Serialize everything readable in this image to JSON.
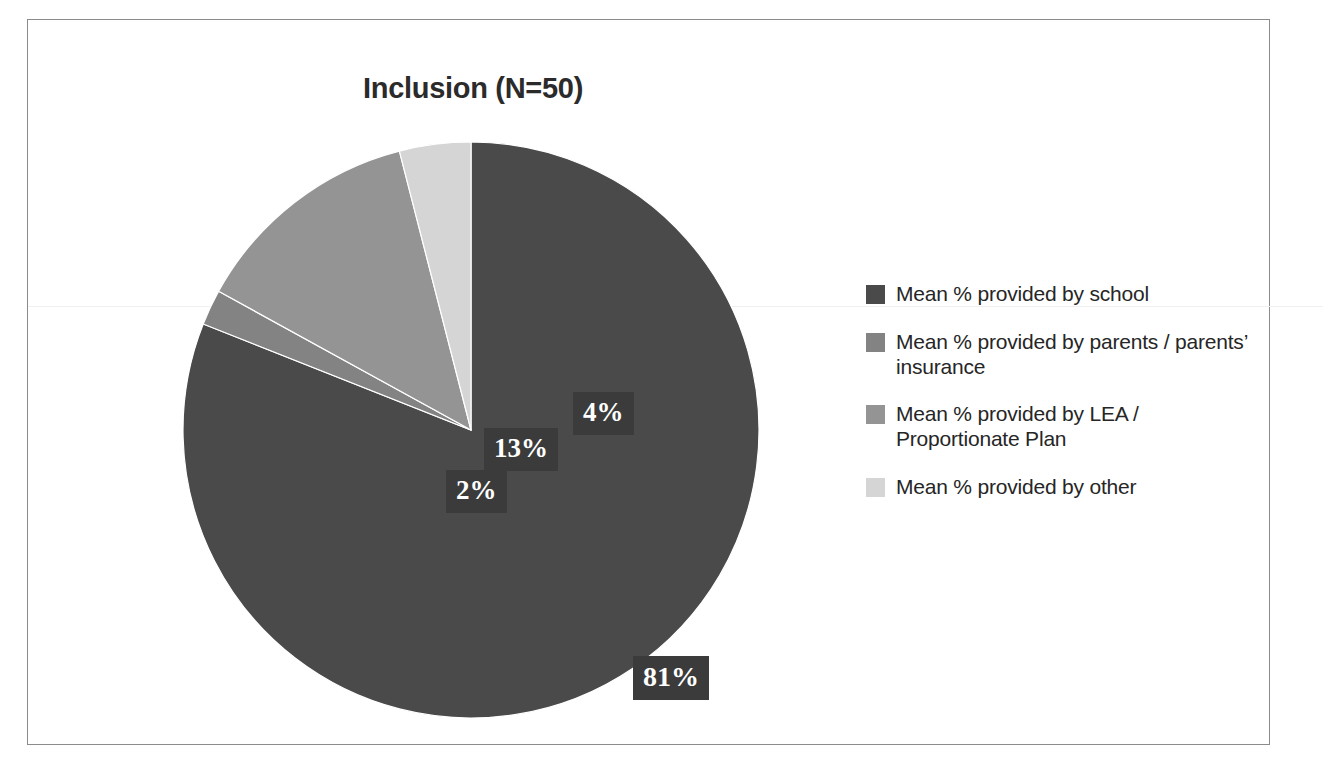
{
  "chart_data": {
    "type": "pie",
    "title": "Inclusion (N=50)",
    "categories": [
      "Mean % provided by school",
      "Mean % provided by parents / parents’ insurance",
      "Mean % provided by LEA / Proportionate Plan",
      "Mean % provided by other"
    ],
    "values": [
      81,
      2,
      13,
      4
    ],
    "value_labels": [
      "81%",
      "2%",
      "13%",
      "4%"
    ],
    "colors": [
      "#4a4a4a",
      "#838383",
      "#949494",
      "#d5d5d5"
    ],
    "units": "percent",
    "start_angle_deg": 0,
    "direction": "clockwise",
    "legend_position": "right",
    "grid": false,
    "xlabel": "",
    "ylabel": "",
    "sample_size": "N=50"
  },
  "frame": {
    "border_color": "#8b8b8b",
    "background": "#ffffff"
  },
  "title": {
    "text": "Inclusion (N=50)"
  },
  "slices": [
    {
      "key": "school",
      "label": "Mean % provided by school",
      "value": 81,
      "value_label": "81%",
      "color": "#4a4a4a"
    },
    {
      "key": "parents",
      "label": "Mean % provided by parents / parents’ insurance",
      "value": 2,
      "value_label": "2%",
      "color": "#838383"
    },
    {
      "key": "lea",
      "label": "Mean % provided by LEA / Proportionate Plan",
      "value": 13,
      "value_label": "13%",
      "color": "#949494"
    },
    {
      "key": "other",
      "label": "Mean % provided by other",
      "value": 4,
      "value_label": "4%",
      "color": "#d5d5d5"
    }
  ],
  "legend": {
    "items": [
      {
        "label": "Mean % provided by school",
        "color": "#4a4a4a"
      },
      {
        "label": "Mean % provided by parents / parents’ insurance",
        "color": "#838383"
      },
      {
        "label": "Mean % provided by LEA / Proportionate Plan",
        "color": "#949494"
      },
      {
        "label": "Mean % provided by other",
        "color": "#d5d5d5"
      }
    ]
  },
  "labels": {
    "school": "81%",
    "parents": "2%",
    "lea": "13%",
    "other": "4%"
  }
}
